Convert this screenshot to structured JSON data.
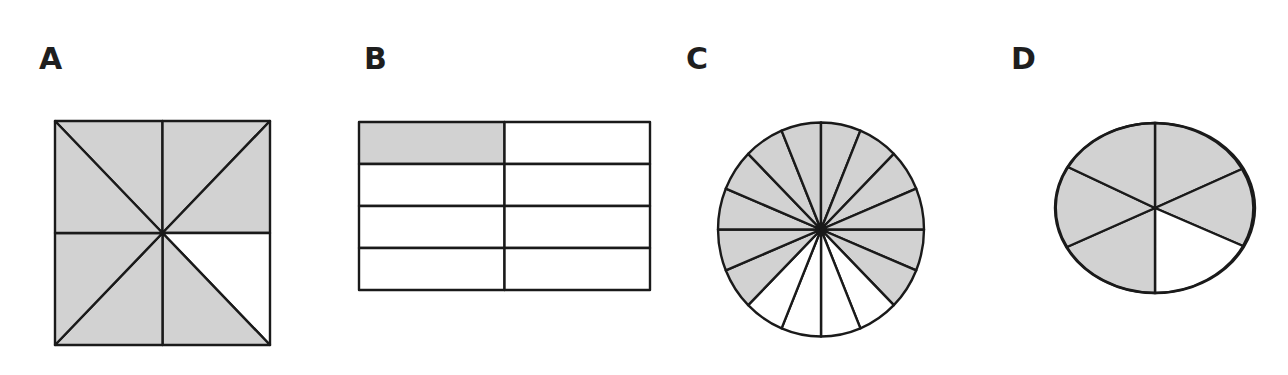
{
  "style": {
    "shaded_color": "#d2d2d2",
    "unshaded_color": "#ffffff",
    "stroke_color": "#1a1a1a",
    "stroke_width": 2.4
  },
  "panels": [
    {
      "label": "A",
      "label_pos": [
        39,
        44
      ],
      "shape": "square-8-triangles",
      "total_parts": 8,
      "shaded_parts": 7,
      "bounds": {
        "x1": 55,
        "y1": 121,
        "x2": 270,
        "y2": 345
      },
      "unshaded_description": "right triangle below the horizontal midline on the right side (upper triangle of bottom-right quadrant)"
    },
    {
      "label": "B",
      "label_pos": [
        364,
        44
      ],
      "shape": "rectangle-grid-2x4",
      "total_parts": 8,
      "shaded_parts": 1,
      "bounds": {
        "x1": 359,
        "y1": 122,
        "x2": 650,
        "y2": 290
      },
      "columns": 2,
      "rows": 4,
      "shaded_cells": [
        [
          0,
          0
        ]
      ]
    },
    {
      "label": "C",
      "label_pos": [
        686,
        44
      ],
      "shape": "circle-16-sectors",
      "total_parts": 16,
      "shaded_parts": 12,
      "center": [
        821,
        229.5
      ],
      "rx": 103,
      "ry": 107,
      "unshaded_sectors_degrees": [
        [
          45,
          135
        ]
      ]
    },
    {
      "label": "D",
      "label_pos": [
        1011,
        44
      ],
      "shape": "ellipse-6-sectors",
      "total_parts": 6,
      "shaded_parts": 5,
      "center": [
        1155,
        208
      ],
      "rx": 100,
      "ry": 85,
      "unshaded_sector": "bottom-right, between downward vertical and lower-right ray"
    }
  ]
}
